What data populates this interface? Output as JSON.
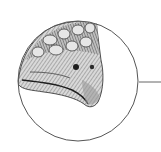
{
  "figure": {
    "subject": "armored reptile head illustration in circular detail callout",
    "colors": {
      "background": "#ffffff",
      "circle_stroke": "#555555",
      "leader_line": "#666666",
      "ink_dark": "#2a2a2a",
      "ink_mid": "#7a7a7a",
      "ink_light": "#c8c8c8"
    },
    "callout": {
      "center_x": 78,
      "center_y": 81,
      "radius": 60,
      "leader_start_x": 139,
      "leader_end_x": 161,
      "leader_y": 82
    }
  }
}
